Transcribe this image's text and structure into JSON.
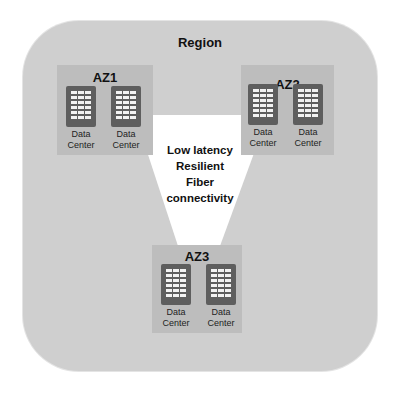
{
  "region": {
    "label": "Region"
  },
  "connectivity": {
    "lines": [
      "Low latency",
      "Resilient",
      "Fiber",
      "connectivity"
    ]
  },
  "availability_zones": [
    {
      "label": "AZ1",
      "data_centers": [
        {
          "line1": "Data",
          "line2": "Center"
        },
        {
          "line1": "Data",
          "line2": "Center"
        }
      ]
    },
    {
      "label": "AZ2",
      "data_centers": [
        {
          "line1": "Data",
          "line2": "Center"
        },
        {
          "line1": "Data",
          "line2": "Center"
        }
      ]
    },
    {
      "label": "AZ3",
      "data_centers": [
        {
          "line1": "Data",
          "line2": "Center"
        },
        {
          "line1": "Data",
          "line2": "Center"
        }
      ]
    }
  ],
  "colors": {
    "region_bg": "#cfcfcf",
    "az_bg": "#bdbdbd",
    "rack": "#5e5e5e",
    "connector": "#ffffff"
  }
}
